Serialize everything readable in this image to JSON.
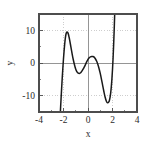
{
  "figure": {
    "name": "polynomial-plot",
    "background_color": "#ffffff",
    "frame_color": "#4d4d4d",
    "grid_color": "#b9b9b9",
    "zero_axis_color": "#8a8a8a",
    "curve_color": "#1a1a1a"
  },
  "chart_data": {
    "type": "line",
    "title": "",
    "xlabel": "x",
    "ylabel": "y",
    "xlim": [
      -4,
      4
    ],
    "ylim": [
      -15,
      15
    ],
    "grid": true,
    "legend": null,
    "xticks": [
      -4,
      -2,
      0,
      2,
      4
    ],
    "xtick_labels": [
      "-4",
      "-2",
      "0",
      "2",
      "4"
    ],
    "yticks": [
      -10,
      0,
      10
    ],
    "ytick_labels": [
      "-10",
      "0",
      "10"
    ],
    "x_minor_ticks": [
      -3,
      -1,
      1,
      3
    ],
    "y_minor_ticks": [
      -5,
      5
    ],
    "series": [
      {
        "name": "curve",
        "x": [
          -2.3,
          -2.25,
          -2.2,
          -2.15,
          -2.1,
          -2.05,
          -2.0,
          -1.95,
          -1.9,
          -1.85,
          -1.8,
          -1.75,
          -1.7,
          -1.65,
          -1.6,
          -1.55,
          -1.5,
          -1.4,
          -1.3,
          -1.2,
          -1.1,
          -1.0,
          -0.9,
          -0.8,
          -0.7,
          -0.6,
          -0.5,
          -0.4,
          -0.3,
          -0.2,
          -0.1,
          0.0,
          0.1,
          0.2,
          0.3,
          0.4,
          0.5,
          0.6,
          0.7,
          0.8,
          0.9,
          1.0,
          1.1,
          1.2,
          1.3,
          1.4,
          1.5,
          1.6,
          1.7,
          1.75,
          1.8,
          1.85,
          1.9,
          1.95,
          2.0,
          2.05,
          2.1,
          2.15,
          2.2,
          2.25,
          2.3
        ],
        "y": [
          -18.0,
          -14.5,
          -11.0,
          -7.6,
          -4.4,
          -1.4,
          1.4,
          3.8,
          5.9,
          7.6,
          8.8,
          9.4,
          9.5,
          9.3,
          8.8,
          8.0,
          7.1,
          5.0,
          2.9,
          1.0,
          -0.6,
          -1.9,
          -2.7,
          -3.1,
          -3.2,
          -3.0,
          -2.5,
          -1.9,
          -1.2,
          -0.4,
          0.4,
          1.1,
          1.6,
          1.9,
          2.0,
          2.0,
          1.8,
          1.3,
          0.6,
          -0.4,
          -1.7,
          -3.2,
          -5.0,
          -6.9,
          -8.8,
          -10.5,
          -11.7,
          -12.2,
          -11.9,
          -11.4,
          -10.5,
          -9.2,
          -7.4,
          -5.0,
          -2.0,
          1.7,
          6.2,
          11.5,
          17.6,
          24.6,
          32.5
        ],
        "color": "#1a1a1a",
        "linewidth": 1.4
      }
    ],
    "features": {
      "local_max_1": {
        "x": -1.7,
        "y": 9.5
      },
      "local_min_1": {
        "x": -0.7,
        "y": -3.2
      },
      "local_max_2": {
        "x": 0.35,
        "y": 2.0
      },
      "local_min_2": {
        "x": 1.7,
        "y": -12.2
      }
    }
  }
}
